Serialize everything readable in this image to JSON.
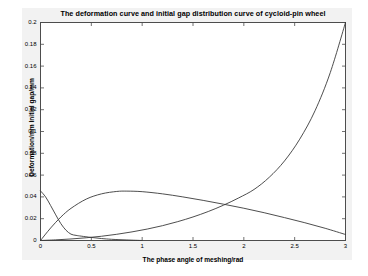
{
  "chart_data": {
    "type": "line",
    "title": "The deformation curve and initial gap distribution curve of cycloid-pin wheel",
    "xlabel": "The phase angle of meshing/rad",
    "ylabel": "Deformation/mm Initial gap/mm",
    "xlim": [
      0,
      3
    ],
    "ylim": [
      0,
      0.2
    ],
    "grid": false,
    "legend": "none",
    "xticks": [
      "0",
      "0.5",
      "1",
      "1.5",
      "2",
      "2.5",
      "3"
    ],
    "xtick_values": [
      0,
      0.5,
      1,
      1.5,
      2,
      2.5,
      3
    ],
    "yticks": [
      "0",
      "0.02",
      "0.04",
      "0.06",
      "0.08",
      "0.1",
      "0.12",
      "0.14",
      "0.16",
      "0.18",
      "0.2"
    ],
    "ytick_values": [
      0,
      0.02,
      0.04,
      0.06,
      0.08,
      0.1,
      0.12,
      0.14,
      0.16,
      0.18,
      0.2
    ],
    "series": [
      {
        "name": "Initial gap distribution curve",
        "x": [
          0,
          0.15,
          0.3,
          0.45,
          0.6,
          0.75,
          0.9,
          1.05,
          1.2,
          1.35,
          1.5,
          1.65,
          1.8,
          1.95,
          2.1,
          2.25,
          2.4,
          2.55,
          2.7,
          2.85,
          3
        ],
        "values": [
          0,
          0.0006,
          0.0014,
          0.0025,
          0.0039,
          0.0057,
          0.0079,
          0.0105,
          0.0136,
          0.0173,
          0.0216,
          0.0266,
          0.0324,
          0.0391,
          0.0468,
          0.058,
          0.073,
          0.093,
          0.119,
          0.154,
          0.2
        ]
      },
      {
        "name": "Deformation curve (hump)",
        "x": [
          0,
          0.1,
          0.2,
          0.3,
          0.45,
          0.6,
          0.75,
          0.85,
          1.0,
          1.2,
          1.4,
          1.6,
          1.8,
          2.0,
          2.2,
          2.4,
          2.6,
          2.8,
          3
        ],
        "values": [
          0,
          0.0115,
          0.0215,
          0.0295,
          0.038,
          0.0428,
          0.045,
          0.0453,
          0.0448,
          0.0428,
          0.04,
          0.0368,
          0.0333,
          0.0296,
          0.0255,
          0.021,
          0.0163,
          0.0112,
          0.0055
        ]
      },
      {
        "name": "Deformation curve (decaying)",
        "x": [
          0,
          0.05,
          0.1,
          0.15,
          0.2,
          0.25,
          0.3,
          0.35,
          0.4,
          0.5,
          0.6,
          0.7,
          0.85,
          1.0
        ],
        "values": [
          0.0455,
          0.04,
          0.032,
          0.0235,
          0.0155,
          0.0095,
          0.0058,
          0.0047,
          0.004,
          0.0028,
          0.0018,
          0.0011,
          0.0005,
          0.0
        ]
      }
    ]
  }
}
